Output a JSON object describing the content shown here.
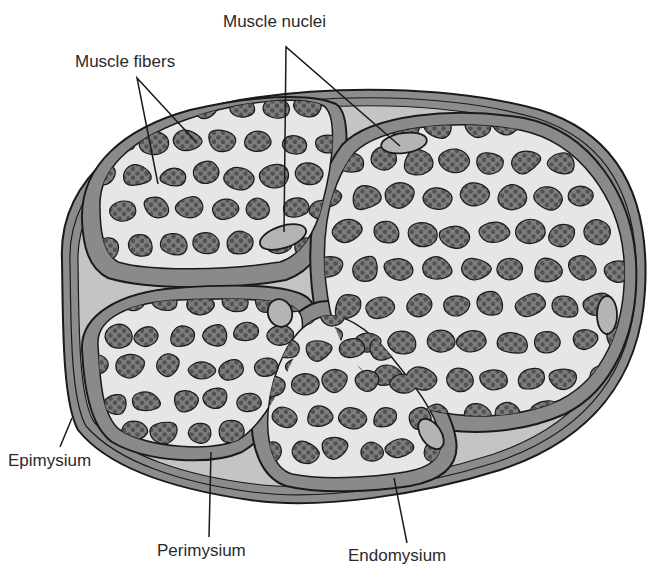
{
  "diagram": {
    "labels": {
      "muscle_fibers": "Muscle fibers",
      "muscle_nuclei": "Muscle nuclei",
      "epimysium": "Epimysium",
      "perimysium": "Perimysium",
      "endomysium": "Endomysium"
    },
    "colors": {
      "background": "#ffffff",
      "epimysium": "#8c8c8c",
      "connective_light": "#c4c4c4",
      "perimysium": "#8a8a8a",
      "endomysium": "#e6e6e6",
      "fiber": "#7a7a7a",
      "myofibril_dot": "#555555",
      "nucleus": "#b4b4b4",
      "outline": "#1a1a1a"
    },
    "fascicles": [
      {
        "name": "upper-left fascicle"
      },
      {
        "name": "right fascicle"
      },
      {
        "name": "lower-left fascicle"
      },
      {
        "name": "lower-middle fascicle"
      }
    ]
  }
}
